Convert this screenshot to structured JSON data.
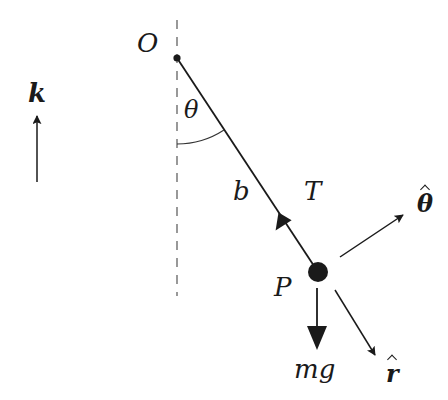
{
  "diagram": {
    "colors": {
      "ink": "#1a1a1a",
      "dashed": "#555555",
      "background": "#ffffff"
    },
    "labels": {
      "pivot": "O",
      "angle": "θ",
      "rod_length": "b",
      "tension": "T",
      "bob": "P",
      "weight": "mg",
      "unit_theta": "θ",
      "unit_r": "r",
      "unit_k": "k"
    },
    "elements": {
      "pivot_point": {
        "x": 177,
        "y": 58
      },
      "bob_point": {
        "x": 318,
        "y": 272,
        "radius": 10
      },
      "vertical_reference": {
        "x": 177,
        "y1": 20,
        "y2": 296,
        "style": "dashed"
      },
      "k_arrow": {
        "x": 37,
        "y_from": 182,
        "y_to": 115
      },
      "weight_arrow": {
        "x": 317,
        "y_from": 288,
        "y_to": 350
      },
      "theta_hat_arrow": {
        "from": [
          340,
          257
        ],
        "to": [
          404,
          214
        ]
      },
      "r_hat_arrow": {
        "from": [
          335,
          290
        ],
        "to": [
          376,
          356
        ]
      },
      "tension_arrowhead": {
        "x": 284,
        "y": 221
      }
    }
  }
}
